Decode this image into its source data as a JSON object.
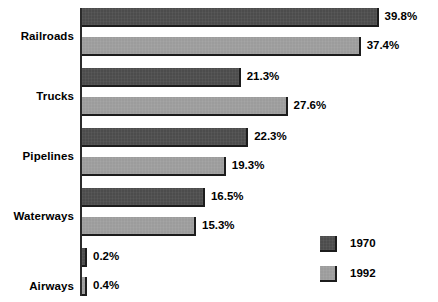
{
  "chart_data": {
    "type": "bar",
    "orientation": "horizontal",
    "title": "",
    "subtitle": "",
    "xlabel": "",
    "ylabel": "",
    "categories": [
      "Railroads",
      "Trucks",
      "Pipelines",
      "Waterways",
      "Airways"
    ],
    "series": [
      {
        "name": "1970",
        "color": "#4c4c4c",
        "values": [
          39.8,
          21.3,
          22.3,
          16.5,
          0.2
        ],
        "value_labels": [
          "39.8%",
          "21.3%",
          "22.3%",
          "16.5%",
          "0.2%"
        ]
      },
      {
        "name": "1992",
        "color": "#9c9c9c",
        "values": [
          37.4,
          27.6,
          19.3,
          15.3,
          0.4
        ],
        "value_labels": [
          "37.4%",
          "27.6%",
          "19.3%",
          "15.3%",
          "0.4%"
        ]
      }
    ],
    "xlim": [
      0,
      40
    ],
    "grid": false,
    "legend_position": "bottom-right",
    "value_suffix": "%"
  },
  "legend": {
    "items": [
      {
        "label": "1970",
        "color": "#4c4c4c"
      },
      {
        "label": "1992",
        "color": "#9c9c9c"
      }
    ]
  },
  "colors": {
    "series_1970": "#4c4c4c",
    "series_1992": "#9c9c9c",
    "axis": "#2b2b2b",
    "text": "#000000",
    "background": "#ffffff"
  }
}
